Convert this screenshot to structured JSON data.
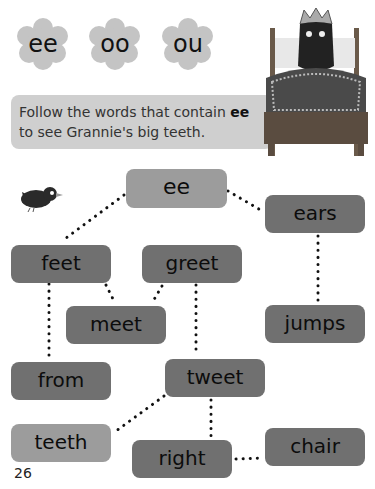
{
  "flowers": [
    {
      "label": "ee"
    },
    {
      "label": "oo"
    },
    {
      "label": "ou"
    }
  ],
  "instruction": {
    "line1_prefix": "Follow the words that contain ",
    "highlight": "ee",
    "line2": "to see Grannie's big teeth."
  },
  "picture": {
    "description": "wolf in grannie's bed with crown"
  },
  "maze": {
    "start": "ee",
    "words": {
      "ears": "ears",
      "feet": "feet",
      "greet": "greet",
      "meet": "meet",
      "jumps": "jumps",
      "from": "from",
      "tweet": "tweet",
      "teeth": "teeth",
      "right": "right",
      "chair": "chair"
    }
  },
  "page_number": "26",
  "colors": {
    "start_box": "#9c9c9c",
    "word_box": "#707070",
    "instruction_bg": "#cfcfcf",
    "flower": "#c4c4c4"
  }
}
